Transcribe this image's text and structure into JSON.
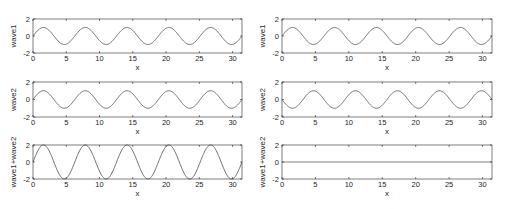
{
  "figure": {
    "width": 507,
    "height": 209,
    "line_color": "#4d4d4d",
    "axis_color": "#262626"
  },
  "chart_data": [
    {
      "type": "line",
      "panel": "left-row1",
      "title": "",
      "xlabel": "x",
      "ylabel": "wave1",
      "xlim": [
        0,
        31.4159
      ],
      "ylim": [
        -2,
        2
      ],
      "xticks": [
        0,
        5,
        10,
        15,
        20,
        25,
        30
      ],
      "yticks": [
        -2,
        0,
        2
      ],
      "function": "sin(x)",
      "amplitude": 1,
      "phase_sign": 1,
      "box": {
        "x0": 33,
        "x1": 242,
        "y0": 19,
        "y1": 53
      }
    },
    {
      "type": "line",
      "panel": "right-row1",
      "title": "",
      "xlabel": "x",
      "ylabel": "wave1",
      "xlim": [
        0,
        31.4159
      ],
      "ylim": [
        -2,
        2
      ],
      "xticks": [
        0,
        5,
        10,
        15,
        20,
        25,
        30
      ],
      "yticks": [
        -2,
        0,
        2
      ],
      "function": "sin(x)",
      "amplitude": 1,
      "phase_sign": 1,
      "box": {
        "x0": 282,
        "x1": 492,
        "y0": 19,
        "y1": 53
      }
    },
    {
      "type": "line",
      "panel": "left-row2",
      "title": "",
      "xlabel": "x",
      "ylabel": "wave2",
      "xlim": [
        0,
        31.4159
      ],
      "ylim": [
        -2,
        2
      ],
      "xticks": [
        0,
        5,
        10,
        15,
        20,
        25,
        30
      ],
      "yticks": [
        -2,
        0,
        2
      ],
      "function": "sin(x)",
      "amplitude": 1,
      "phase_sign": 1,
      "box": {
        "x0": 33,
        "x1": 242,
        "y0": 82,
        "y1": 117
      }
    },
    {
      "type": "line",
      "panel": "right-row2",
      "title": "",
      "xlabel": "x",
      "ylabel": "wave2",
      "xlim": [
        0,
        31.4159
      ],
      "ylim": [
        -2,
        2
      ],
      "xticks": [
        0,
        5,
        10,
        15,
        20,
        25,
        30
      ],
      "yticks": [
        -2,
        0,
        2
      ],
      "function": "-sin(x)",
      "amplitude": 1,
      "phase_sign": -1,
      "box": {
        "x0": 282,
        "x1": 492,
        "y0": 82,
        "y1": 117
      }
    },
    {
      "type": "line",
      "panel": "left-row3",
      "title": "",
      "xlabel": "x",
      "ylabel": "wave1+wave2",
      "xlim": [
        0,
        31.4159
      ],
      "ylim": [
        -2,
        2
      ],
      "xticks": [
        0,
        5,
        10,
        15,
        20,
        25,
        30
      ],
      "yticks": [
        -2,
        0,
        2
      ],
      "function": "2*sin(x)",
      "amplitude": 2,
      "phase_sign": 1,
      "box": {
        "x0": 33,
        "x1": 242,
        "y0": 145,
        "y1": 179
      }
    },
    {
      "type": "line",
      "panel": "right-row3",
      "title": "",
      "xlabel": "x",
      "ylabel": "wave1+wave2",
      "xlim": [
        0,
        31.4159
      ],
      "ylim": [
        -2,
        2
      ],
      "xticks": [
        0,
        5,
        10,
        15,
        20,
        25,
        30
      ],
      "yticks": [
        -2,
        0,
        2
      ],
      "function": "0",
      "amplitude": 0,
      "phase_sign": 1,
      "box": {
        "x0": 282,
        "x1": 492,
        "y0": 145,
        "y1": 179
      }
    }
  ]
}
